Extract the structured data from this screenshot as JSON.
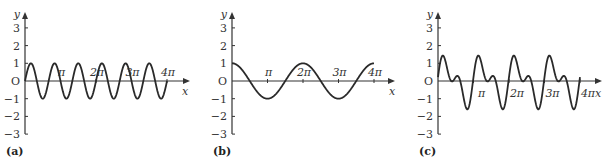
{
  "chart_data": [
    {
      "type": "line",
      "panel_label": "(a)",
      "xlabel": "x",
      "ylabel": "y",
      "origin_label": "O",
      "x_ticks": [
        "π",
        "2π",
        "3π",
        "4π"
      ],
      "y_ticks": [
        "3",
        "2",
        "1",
        "−1",
        "−2",
        "−3"
      ],
      "ylim": [
        -3,
        3
      ],
      "xlim": [
        0,
        12.566
      ],
      "function": "sin(3x)",
      "amplitude": 1
    },
    {
      "type": "line",
      "panel_label": "(b)",
      "xlabel": "x",
      "ylabel": "y",
      "origin_label": "O",
      "x_ticks": [
        "π",
        "2π",
        "3π",
        "4π"
      ],
      "y_ticks": [
        "3",
        "2",
        "1",
        "−1",
        "−2",
        "−3"
      ],
      "ylim": [
        -3,
        3
      ],
      "xlim": [
        0,
        12.566
      ],
      "function": "cos(x)",
      "amplitude": 1
    },
    {
      "type": "line",
      "panel_label": "(c)",
      "xlabel": "x",
      "ylabel": "y",
      "origin_label": "O",
      "x_ticks": [
        "π",
        "2π",
        "3π",
        "4π"
      ],
      "y_ticks": [
        "3",
        "2",
        "1",
        "−1",
        "−2",
        "−3"
      ],
      "ylim": [
        -3,
        3
      ],
      "xlim": [
        0,
        12.566
      ],
      "function": "sum of sinusoids (period π)",
      "max": 1.7,
      "min": -1.7
    }
  ],
  "panels": [
    {
      "label": "(a)",
      "x": "x",
      "y": "y",
      "o": "O"
    },
    {
      "label": "(b)",
      "x": "x",
      "y": "y",
      "o": "O"
    },
    {
      "label": "(c)",
      "x": "x",
      "y": "y",
      "o": "O"
    }
  ],
  "ticks": {
    "pi": "π",
    "two_pi": "2π",
    "three_pi": "3π",
    "four_pi": "4π",
    "y3": "3",
    "y2": "2",
    "y1": "1",
    "ym1": "−1",
    "ym2": "−2",
    "ym3": "−3"
  }
}
